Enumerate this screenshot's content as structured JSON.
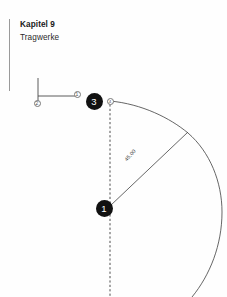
{
  "page": {
    "width": 227,
    "height": 297,
    "background": "#fefefe"
  },
  "header": {
    "chapter": "Kapitel 9",
    "subtitle": "Tragwerke",
    "rule_color": "#9a9a9a"
  },
  "diagram": {
    "stroke_color": "#4a4a4a",
    "marker_fill": "#111111",
    "marker_text": "#ffffff",
    "dashed_color": "#3a3a3a",
    "radius_label": "45,00",
    "markers": [
      {
        "id": "marker-2",
        "label": "2",
        "style": "outline",
        "cx": 37,
        "cy": 103
      },
      {
        "id": "marker-1-small",
        "label": "1",
        "style": "outline",
        "cx": 77,
        "cy": 94
      },
      {
        "id": "marker-3",
        "label": "3",
        "style": "filled",
        "cx": 94,
        "cy": 101
      },
      {
        "id": "marker-4-small",
        "label": "4",
        "style": "outline",
        "cx": 110,
        "cy": 101
      },
      {
        "id": "marker-1-large",
        "label": "1",
        "style": "filled",
        "cx": 104,
        "cy": 208
      }
    ],
    "geometry": {
      "vertical_stub": {
        "x": 38,
        "y1": 78,
        "y2": 101
      },
      "horizontal_rail": {
        "y": 96,
        "x1": 38,
        "x2": 77
      },
      "dashed_axis": {
        "x": 110,
        "y1": 100,
        "y2": 297
      },
      "radius_line": {
        "x1": 110,
        "y1": 206,
        "x2": 187,
        "y2": 133
      },
      "arc": {
        "cx": 104,
        "cy": 208,
        "r": 107,
        "from_deg": 222,
        "to_deg": 352
      }
    }
  }
}
